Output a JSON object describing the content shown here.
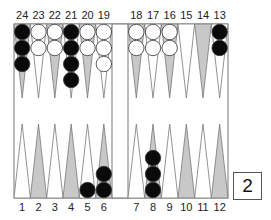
{
  "board": {
    "colors": {
      "dark_point": "#c8c8c8",
      "light_point": "#ffffff",
      "outline": "#777777",
      "black_checker": "#0a0a0a",
      "white_checker": "#ffffff"
    },
    "top_labels": [
      "24",
      "23",
      "22",
      "21",
      "20",
      "19",
      "18",
      "17",
      "16",
      "15",
      "14",
      "13"
    ],
    "bottom_labels": [
      "1",
      "2",
      "3",
      "4",
      "5",
      "6",
      "7",
      "8",
      "9",
      "10",
      "11",
      "12"
    ],
    "points": [
      {
        "point": 24,
        "row": "top",
        "col": 0,
        "shade": "dark",
        "color": "black",
        "count": 3
      },
      {
        "point": 23,
        "row": "top",
        "col": 1,
        "shade": "light",
        "color": "white",
        "count": 2
      },
      {
        "point": 22,
        "row": "top",
        "col": 2,
        "shade": "dark",
        "color": "white",
        "count": 2
      },
      {
        "point": 21,
        "row": "top",
        "col": 3,
        "shade": "light",
        "color": "black",
        "count": 4
      },
      {
        "point": 20,
        "row": "top",
        "col": 4,
        "shade": "dark",
        "color": "white",
        "count": 2
      },
      {
        "point": 19,
        "row": "top",
        "col": 5,
        "shade": "light",
        "color": "white",
        "count": 3
      },
      {
        "point": 18,
        "row": "top",
        "col": 6,
        "shade": "dark",
        "color": "white",
        "count": 2
      },
      {
        "point": 17,
        "row": "top",
        "col": 7,
        "shade": "light",
        "color": "white",
        "count": 2
      },
      {
        "point": 16,
        "row": "top",
        "col": 8,
        "shade": "dark",
        "color": "white",
        "count": 2
      },
      {
        "point": 15,
        "row": "top",
        "col": 9,
        "shade": "light",
        "color": "none",
        "count": 0
      },
      {
        "point": 14,
        "row": "top",
        "col": 10,
        "shade": "dark",
        "color": "none",
        "count": 0
      },
      {
        "point": 13,
        "row": "top",
        "col": 11,
        "shade": "light",
        "color": "black",
        "count": 2
      },
      {
        "point": 1,
        "row": "bottom",
        "col": 0,
        "shade": "light",
        "color": "none",
        "count": 0
      },
      {
        "point": 2,
        "row": "bottom",
        "col": 1,
        "shade": "dark",
        "color": "none",
        "count": 0
      },
      {
        "point": 3,
        "row": "bottom",
        "col": 2,
        "shade": "light",
        "color": "none",
        "count": 0
      },
      {
        "point": 4,
        "row": "bottom",
        "col": 3,
        "shade": "dark",
        "color": "none",
        "count": 0
      },
      {
        "point": 5,
        "row": "bottom",
        "col": 4,
        "shade": "light",
        "color": "black",
        "count": 1
      },
      {
        "point": 6,
        "row": "bottom",
        "col": 5,
        "shade": "dark",
        "color": "black",
        "count": 2
      },
      {
        "point": 7,
        "row": "bottom",
        "col": 6,
        "shade": "light",
        "color": "none",
        "count": 0
      },
      {
        "point": 8,
        "row": "bottom",
        "col": 7,
        "shade": "dark",
        "color": "black",
        "count": 3
      },
      {
        "point": 9,
        "row": "bottom",
        "col": 8,
        "shade": "light",
        "color": "none",
        "count": 0
      },
      {
        "point": 10,
        "row": "bottom",
        "col": 9,
        "shade": "dark",
        "color": "none",
        "count": 0
      },
      {
        "point": 11,
        "row": "bottom",
        "col": 10,
        "shade": "light",
        "color": "none",
        "count": 0
      },
      {
        "point": 12,
        "row": "bottom",
        "col": 11,
        "shade": "dark",
        "color": "none",
        "count": 0
      }
    ]
  },
  "doubling_cube": {
    "value": "2"
  }
}
